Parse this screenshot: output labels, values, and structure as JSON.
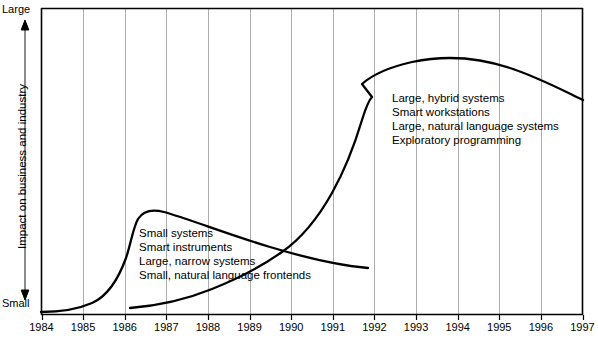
{
  "chart_data": {
    "type": "line",
    "title": "",
    "xlabel": "",
    "ylabel": "Impact on business and industry",
    "y_axis_top_label": "Large",
    "y_axis_bottom_label": "Small",
    "grid": true,
    "legend": "none",
    "xlim": [
      1984,
      1997
    ],
    "ylim": [
      "Small",
      "Large"
    ],
    "xticks": [
      "1984",
      "1985",
      "1986",
      "1987",
      "1988",
      "1989",
      "1990",
      "1991",
      "1992",
      "1993",
      "1994",
      "1995",
      "1996",
      "1997"
    ],
    "series": [
      {
        "name": "First generation wave",
        "comment": "Rises from Small at 1984, peaks just after 1986, folds back and declines to a low tail ending near 1992.",
        "points": [
          {
            "x": 1984.0,
            "y": 0.01
          },
          {
            "x": 1984.6,
            "y": 0.03
          },
          {
            "x": 1985.2,
            "y": 0.1
          },
          {
            "x": 1985.8,
            "y": 0.22
          },
          {
            "x": 1986.2,
            "y": 0.33
          },
          {
            "x": 1986.5,
            "y": 0.4
          },
          {
            "x": 1987.0,
            "y": 0.4
          },
          {
            "x": 1987.8,
            "y": 0.35
          },
          {
            "x": 1989.0,
            "y": 0.29
          },
          {
            "x": 1990.5,
            "y": 0.23
          },
          {
            "x": 1992.0,
            "y": 0.18
          }
        ]
      },
      {
        "name": "Second generation wave",
        "comment": "Starts low near 1986, rises slowly then steeply through 1991-1992, cusps back at 1992, peaks near 1994 and eases to 1997.",
        "points": [
          {
            "x": 1986.1,
            "y": 0.03
          },
          {
            "x": 1987.0,
            "y": 0.05
          },
          {
            "x": 1988.0,
            "y": 0.09
          },
          {
            "x": 1989.0,
            "y": 0.15
          },
          {
            "x": 1990.0,
            "y": 0.23
          },
          {
            "x": 1991.0,
            "y": 0.38
          },
          {
            "x": 1991.8,
            "y": 0.55
          },
          {
            "x": 1992.3,
            "y": 0.68
          },
          {
            "x": 1992.0,
            "y": 0.73
          },
          {
            "x": 1992.6,
            "y": 0.8
          },
          {
            "x": 1993.6,
            "y": 0.86
          },
          {
            "x": 1994.8,
            "y": 0.88
          },
          {
            "x": 1996.0,
            "y": 0.84
          },
          {
            "x": 1997.0,
            "y": 0.78
          }
        ]
      }
    ],
    "annotations": [
      {
        "id": "early",
        "anchor_x": 1986.4,
        "lines": [
          "Small systems",
          "Smart instruments",
          "Large, narrow systems",
          "Small, natural language frontends"
        ]
      },
      {
        "id": "late",
        "anchor_x": 1992.4,
        "lines": [
          "Large, hybrid systems",
          "Smart workstations",
          "Large, natural language systems",
          "Exploratory programming"
        ]
      }
    ]
  },
  "colors": {
    "curve": "#000000",
    "frame": "#000000",
    "gridline": "#8a8a8a",
    "background": "#ffffff",
    "text": "#000000"
  }
}
